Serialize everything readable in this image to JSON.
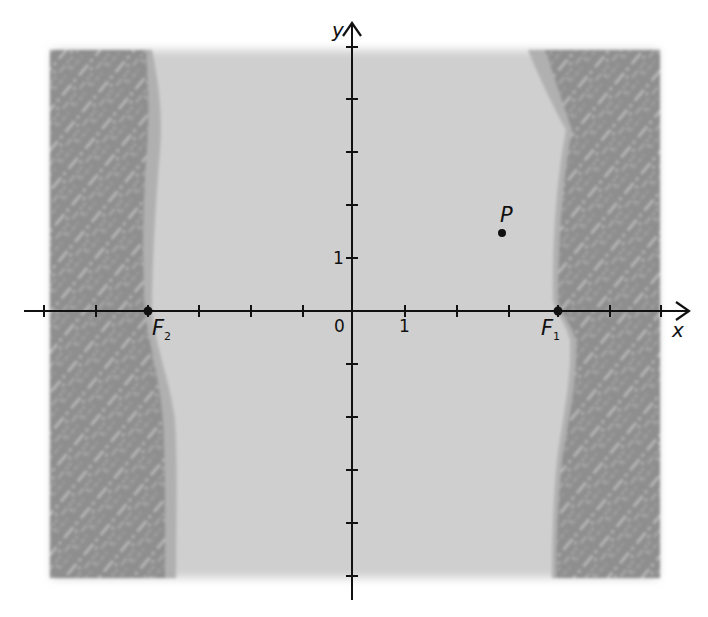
{
  "figure": {
    "colors": {
      "background": "#ffffff",
      "water": "#cdcdcd",
      "shore": "#8f8f8f",
      "shore_edge": "#b3b3b3",
      "shore_texture": "#d8d8d8",
      "axis": "#111111"
    },
    "axes": {
      "x_label": "x",
      "y_label": "y",
      "origin_label": "0",
      "x_unit_label": "1",
      "y_unit_label": "1",
      "x_ticks": [
        -6,
        -5,
        -4,
        -3,
        -2,
        -1,
        1,
        2,
        3,
        4,
        5,
        6
      ],
      "y_ticks": [
        -5,
        -4,
        -3,
        -2,
        -1,
        1,
        2,
        3,
        4,
        5
      ],
      "x_range": [
        -6.4,
        6.5
      ],
      "y_range": [
        -5.4,
        5.5
      ]
    },
    "points": [
      {
        "id": "F1",
        "label": "F",
        "subscript": "1",
        "x": 4,
        "y": 0
      },
      {
        "id": "F2",
        "label": "F",
        "subscript": "2",
        "x": -4,
        "y": 0
      },
      {
        "id": "P",
        "label": "P",
        "subscript": "",
        "x": 3,
        "y": 1.5
      }
    ],
    "regions": [
      {
        "name": "left-shore",
        "description": "textured land strip along left edge"
      },
      {
        "name": "water-channel",
        "description": "light gray channel between shores"
      },
      {
        "name": "right-shore",
        "description": "textured land strip along right edge"
      }
    ]
  }
}
